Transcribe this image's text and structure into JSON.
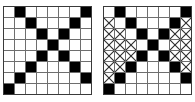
{
  "figure": {
    "background_color": "#ffffff",
    "grid_line_color": "#6e6e6e",
    "border_color": "#3a3a3a",
    "filled_cell_color": "#000000",
    "empty_cell_color": "#ffffff",
    "xmark_color": "#2b2b2b",
    "rows": 8,
    "columns": 8,
    "cell_size_px": 10
  },
  "chart_data": {
    "type": "heatmap",
    "xlabel": "",
    "ylabel": "",
    "categories": [
      "0",
      "1",
      "2",
      "3",
      "4",
      "5",
      "6",
      "7"
    ],
    "row_labels": [
      "0",
      "1",
      "2",
      "3",
      "4",
      "5",
      "6",
      "7"
    ],
    "legend": [
      {
        "key": "filled",
        "label": "black cell",
        "color": "#000000"
      },
      {
        "key": "empty",
        "label": "white cell",
        "color": "#ffffff"
      },
      {
        "key": "xmark",
        "label": "crossed cell",
        "color": "#2b2b2b"
      }
    ],
    "panels": [
      {
        "name": "left-grid",
        "label": "",
        "values": [
          [
            0,
            1,
            0,
            0,
            0,
            0,
            0,
            1
          ],
          [
            0,
            0,
            1,
            0,
            0,
            0,
            1,
            0
          ],
          [
            0,
            0,
            0,
            1,
            0,
            1,
            0,
            0
          ],
          [
            0,
            0,
            0,
            0,
            1,
            0,
            0,
            0
          ],
          [
            0,
            0,
            0,
            1,
            0,
            1,
            0,
            0
          ],
          [
            0,
            0,
            1,
            0,
            0,
            0,
            1,
            0
          ],
          [
            0,
            1,
            0,
            0,
            0,
            0,
            0,
            1
          ],
          [
            1,
            0,
            0,
            0,
            0,
            0,
            0,
            0
          ]
        ],
        "xmarks": [
          [
            0,
            0,
            0,
            0,
            0,
            0,
            0,
            0
          ],
          [
            0,
            0,
            0,
            0,
            0,
            0,
            0,
            0
          ],
          [
            0,
            0,
            0,
            0,
            0,
            0,
            0,
            0
          ],
          [
            0,
            0,
            0,
            0,
            0,
            0,
            0,
            0
          ],
          [
            0,
            0,
            0,
            0,
            0,
            0,
            0,
            0
          ],
          [
            0,
            0,
            0,
            0,
            0,
            0,
            0,
            0
          ],
          [
            0,
            0,
            0,
            0,
            0,
            0,
            0,
            0
          ],
          [
            0,
            0,
            0,
            0,
            0,
            0,
            0,
            0
          ]
        ]
      },
      {
        "name": "right-grid",
        "label": "",
        "values": [
          [
            0,
            1,
            0,
            0,
            0,
            0,
            0,
            1
          ],
          [
            0,
            0,
            1,
            0,
            0,
            0,
            1,
            0
          ],
          [
            0,
            0,
            0,
            1,
            0,
            1,
            0,
            0
          ],
          [
            0,
            0,
            0,
            0,
            1,
            0,
            0,
            0
          ],
          [
            0,
            0,
            0,
            1,
            0,
            1,
            0,
            0
          ],
          [
            0,
            0,
            1,
            0,
            0,
            0,
            1,
            0
          ],
          [
            0,
            1,
            0,
            0,
            0,
            0,
            0,
            1
          ],
          [
            1,
            0,
            0,
            0,
            0,
            0,
            0,
            0
          ]
        ],
        "xmarks": [
          [
            0,
            0,
            0,
            0,
            0,
            0,
            0,
            0
          ],
          [
            1,
            0,
            0,
            0,
            0,
            0,
            0,
            1
          ],
          [
            1,
            1,
            0,
            0,
            0,
            0,
            1,
            1
          ],
          [
            1,
            1,
            1,
            0,
            0,
            0,
            1,
            1
          ],
          [
            1,
            1,
            1,
            0,
            0,
            0,
            1,
            1
          ],
          [
            1,
            1,
            0,
            0,
            0,
            0,
            1,
            1
          ],
          [
            1,
            0,
            0,
            0,
            0,
            0,
            0,
            0
          ],
          [
            0,
            0,
            0,
            0,
            0,
            0,
            0,
            0
          ]
        ]
      }
    ]
  }
}
